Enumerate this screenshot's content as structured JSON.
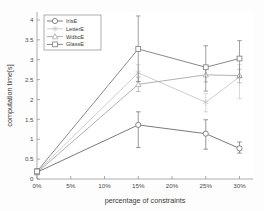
{
  "chart_data": {
    "type": "line",
    "title": "",
    "xlabel": "percentage of constraints",
    "ylabel": "computation time[s]",
    "xlim": [
      0,
      32
    ],
    "ylim": [
      0,
      4.2
    ],
    "grid": false,
    "legend_position": "top-left",
    "x": [
      0,
      15,
      25,
      30
    ],
    "xtick_values": [
      0,
      5,
      10,
      15,
      20,
      25,
      30
    ],
    "xtick_labels": [
      "0%",
      "5%",
      "10%",
      "15%",
      "20%",
      "25%",
      "30%"
    ],
    "ytick_values": [
      0,
      0.5,
      1,
      1.5,
      2,
      2.5,
      3,
      3.5,
      4
    ],
    "ytick_labels": [
      "0",
      "0.5",
      "1",
      "1.5",
      "2",
      "2.5",
      "3",
      "3.5",
      "4"
    ],
    "series": [
      {
        "name": "IrisE",
        "marker": "circle",
        "color": "#6b6b6b",
        "values": [
          0.17,
          1.36,
          1.14,
          0.77
        ],
        "err_low": [
          0.05,
          0.57,
          0.39,
          0.12
        ],
        "err_high": [
          0.05,
          0.33,
          0.35,
          0.16
        ]
      },
      {
        "name": "LetterE",
        "marker": "star",
        "color": "#c8c8c8",
        "values": [
          0.18,
          2.67,
          1.93,
          2.57
        ],
        "err_low": [
          0.06,
          0.22,
          0.24,
          0.55
        ],
        "err_high": [
          0.06,
          0.2,
          0.22,
          0.3
        ]
      },
      {
        "name": "WdbcE",
        "marker": "triangle",
        "color": "#a8a8a8",
        "values": [
          0.16,
          2.38,
          2.62,
          2.6
        ],
        "err_low": [
          0.05,
          0.18,
          0.18,
          0.18
        ],
        "err_high": [
          0.05,
          0.18,
          0.16,
          0.16
        ]
      },
      {
        "name": "GlassE",
        "marker": "square",
        "color": "#7a7a7a",
        "values": [
          0.19,
          3.27,
          2.81,
          3.03
        ],
        "err_low": [
          0.07,
          0.82,
          0.6,
          0.47
        ],
        "err_high": [
          0.07,
          0.83,
          0.54,
          0.45
        ]
      }
    ]
  },
  "legend": {
    "entries": [
      "IrisE",
      "LetterE",
      "WdbcE",
      "GlassE"
    ]
  }
}
